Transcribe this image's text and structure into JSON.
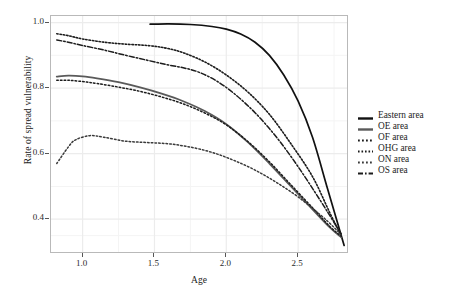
{
  "chart_data": {
    "type": "line",
    "title": "",
    "xlabel": "Age",
    "ylabel": "Rate of spread vulnerability",
    "xlim": [
      0.78,
      2.84
    ],
    "ylim": [
      0.3,
      1.02
    ],
    "xticks": [
      "1.0",
      "1.5",
      "2.0",
      "2.5"
    ],
    "xtick_values": [
      1.0,
      1.5,
      2.0,
      2.5
    ],
    "yticks": [
      "1.0",
      "0.8",
      "0.6",
      "0.4"
    ],
    "ytick_values": [
      1.0,
      0.8,
      0.6,
      0.4
    ],
    "grid": true,
    "legend_position": "right",
    "series": [
      {
        "name": "Eastern area",
        "style": "solid",
        "color": "#111111",
        "width": 1.7,
        "x": [
          1.47,
          1.6,
          1.75,
          1.9,
          2.0,
          2.1,
          2.2,
          2.3,
          2.4,
          2.5,
          2.6,
          2.7,
          2.78,
          2.82
        ],
        "y": [
          0.995,
          0.996,
          0.994,
          0.988,
          0.98,
          0.965,
          0.94,
          0.9,
          0.84,
          0.76,
          0.65,
          0.5,
          0.38,
          0.32
        ]
      },
      {
        "name": "OE area",
        "style": "solid",
        "color": "#5a5a5a",
        "width": 1.8,
        "x": [
          0.82,
          0.9,
          1.0,
          1.1,
          1.25,
          1.4,
          1.55,
          1.7,
          1.85,
          2.0,
          2.15,
          2.3,
          2.45,
          2.6,
          2.72,
          2.8
        ],
        "y": [
          0.835,
          0.838,
          0.836,
          0.83,
          0.818,
          0.802,
          0.783,
          0.76,
          0.73,
          0.69,
          0.635,
          0.57,
          0.5,
          0.43,
          0.375,
          0.345
        ]
      },
      {
        "name": "OF area",
        "style": "dotted",
        "color": "#1c1c1c",
        "width": 1.5,
        "x": [
          0.82,
          0.9,
          1.0,
          1.1,
          1.25,
          1.4,
          1.55,
          1.7,
          1.85,
          2.0,
          2.15,
          2.3,
          2.45,
          2.6,
          2.72,
          2.8
        ],
        "y": [
          0.824,
          0.824,
          0.82,
          0.814,
          0.803,
          0.79,
          0.773,
          0.752,
          0.724,
          0.688,
          0.637,
          0.575,
          0.505,
          0.435,
          0.378,
          0.348
        ]
      },
      {
        "name": "OHG area",
        "style": "dotted-fine",
        "color": "#1c1c1c",
        "width": 1.6,
        "x": [
          0.82,
          0.9,
          1.0,
          1.15,
          1.3,
          1.45,
          1.58,
          1.7,
          1.85,
          2.0,
          2.15,
          2.3,
          2.45,
          2.6,
          2.72,
          2.8
        ],
        "y": [
          0.966,
          0.96,
          0.95,
          0.94,
          0.934,
          0.93,
          0.922,
          0.908,
          0.88,
          0.84,
          0.788,
          0.72,
          0.63,
          0.53,
          0.42,
          0.35
        ]
      },
      {
        "name": "ON area",
        "style": "dotted",
        "color": "#3a3a3a",
        "width": 1.5,
        "x": [
          0.82,
          0.9,
          0.95,
          1.05,
          1.15,
          1.3,
          1.45,
          1.6,
          1.75,
          1.9,
          2.05,
          2.2,
          2.35,
          2.5,
          2.65,
          2.75,
          2.8
        ],
        "y": [
          0.57,
          0.62,
          0.642,
          0.655,
          0.65,
          0.638,
          0.634,
          0.63,
          0.62,
          0.604,
          0.58,
          0.55,
          0.512,
          0.468,
          0.415,
          0.375,
          0.352
        ]
      },
      {
        "name": "OS area",
        "style": "dashdot",
        "color": "#1c1c1c",
        "width": 1.5,
        "x": [
          0.82,
          0.9,
          1.0,
          1.15,
          1.3,
          1.45,
          1.58,
          1.7,
          1.8,
          1.92,
          2.05,
          2.2,
          2.35,
          2.5,
          2.65,
          2.75,
          2.8
        ],
        "y": [
          0.947,
          0.94,
          0.93,
          0.916,
          0.9,
          0.885,
          0.872,
          0.862,
          0.85,
          0.825,
          0.785,
          0.725,
          0.65,
          0.56,
          0.46,
          0.39,
          0.355
        ]
      }
    ]
  },
  "legend": {
    "items": [
      {
        "label": "Eastern area",
        "key": "solid-dark"
      },
      {
        "label": "OE area",
        "key": "solid-gray"
      },
      {
        "label": "OF area",
        "key": "dotted"
      },
      {
        "label": "OHG area",
        "key": "dotted-fine"
      },
      {
        "label": "ON area",
        "key": "dotted-light"
      },
      {
        "label": "OS area",
        "key": "dashdot"
      }
    ]
  }
}
